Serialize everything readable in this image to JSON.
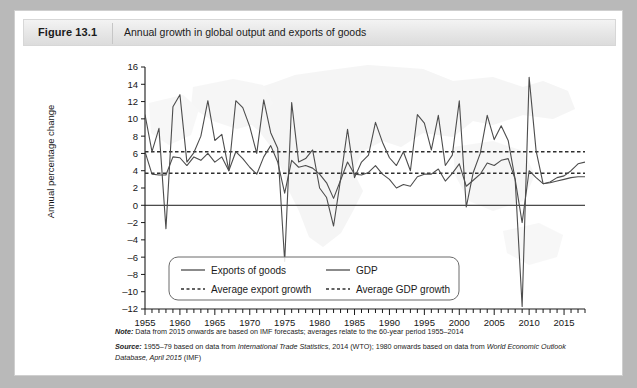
{
  "figure": {
    "number": "Figure 13.1",
    "caption": "Annual growth in global output and exports of goods"
  },
  "notes": {
    "note_label": "Note:",
    "note_text": " Data from 2015 onwards are based on IMF forecasts; averages relate to the 60-year period 1955–2014",
    "source_label": "Source:",
    "source_a": " 1955–79 based on data from ",
    "source_italic_1": "International Trade Statistics",
    "source_b": ", 2014 (WTO); 1980 onwards based on data from ",
    "source_italic_2": "World Economic Outlook Database, April 2015",
    "source_c": " (IMF)"
  },
  "chart_data": {
    "type": "line",
    "title": "Annual growth in global output and exports of goods",
    "xlabel": "",
    "ylabel": "Annual percentage change",
    "xlim": [
      1955,
      2018
    ],
    "ylim": [
      -12,
      16
    ],
    "ytick_step": 2,
    "yticks": [
      -12,
      -10,
      -8,
      -6,
      -4,
      -2,
      0,
      2,
      4,
      6,
      8,
      10,
      12,
      14,
      16
    ],
    "xticks_major": [
      1955,
      1960,
      1965,
      1970,
      1975,
      1980,
      1985,
      1990,
      1995,
      2000,
      2005,
      2010,
      2015
    ],
    "minor_tick_interval": 1,
    "grid": false,
    "legend_position": "lower-left-inside",
    "zero_line": 0,
    "series": [
      {
        "name": "Exports of goods",
        "style": "solid",
        "color": "#4d4d4d",
        "x": [
          1955,
          1956,
          1957,
          1958,
          1959,
          1960,
          1961,
          1962,
          1963,
          1964,
          1965,
          1966,
          1967,
          1968,
          1969,
          1970,
          1971,
          1972,
          1973,
          1974,
          1975,
          1976,
          1977,
          1978,
          1979,
          1980,
          1981,
          1982,
          1983,
          1984,
          1985,
          1986,
          1987,
          1988,
          1989,
          1990,
          1991,
          1992,
          1993,
          1994,
          1995,
          1996,
          1997,
          1998,
          1999,
          2000,
          2001,
          2002,
          2003,
          2004,
          2005,
          2006,
          2007,
          2008,
          2009,
          2010,
          2011,
          2012,
          2013,
          2014,
          2015,
          2016,
          2017,
          2018
        ],
        "values": [
          10.5,
          6.2,
          8.9,
          -2.7,
          11.4,
          12.8,
          5.0,
          6.1,
          8.0,
          12.1,
          7.5,
          8.2,
          4.0,
          12.1,
          11.3,
          9.1,
          6.0,
          12.2,
          8.4,
          6.6,
          -6.5,
          11.9,
          5.0,
          5.4,
          6.4,
          2.0,
          0.9,
          -2.4,
          3.0,
          8.8,
          3.2,
          5.0,
          5.8,
          9.6,
          7.3,
          5.5,
          4.6,
          6.2,
          4.0,
          10.5,
          9.5,
          6.4,
          10.4,
          4.6,
          5.8,
          12.1,
          -0.2,
          3.8,
          6.0,
          10.4,
          7.6,
          9.2,
          7.5,
          3.0,
          -11.7,
          14.8,
          6.3,
          2.5,
          2.7,
          3.2,
          3.4,
          4.0,
          4.8,
          5.0
        ]
      },
      {
        "name": "GDP",
        "style": "solid",
        "color": "#4d4d4d",
        "x": [
          1955,
          1956,
          1957,
          1958,
          1959,
          1960,
          1961,
          1962,
          1963,
          1964,
          1965,
          1966,
          1967,
          1968,
          1969,
          1970,
          1971,
          1972,
          1973,
          1974,
          1975,
          1976,
          1977,
          1978,
          1979,
          1980,
          1981,
          1982,
          1983,
          1984,
          1985,
          1986,
          1987,
          1988,
          1989,
          1990,
          1991,
          1992,
          1993,
          1994,
          1995,
          1996,
          1997,
          1998,
          1999,
          2000,
          2001,
          2002,
          2003,
          2004,
          2005,
          2006,
          2007,
          2008,
          2009,
          2010,
          2011,
          2012,
          2013,
          2014,
          2015,
          2016,
          2017,
          2018
        ],
        "values": [
          6.2,
          3.6,
          3.5,
          3.5,
          5.6,
          5.5,
          4.6,
          5.6,
          5.2,
          6.0,
          5.0,
          5.6,
          4.0,
          6.2,
          5.4,
          4.4,
          3.6,
          5.6,
          6.9,
          5.0,
          1.4,
          5.2,
          4.4,
          4.6,
          4.3,
          3.6,
          2.6,
          0.8,
          2.9,
          5.0,
          3.6,
          3.5,
          3.8,
          4.6,
          3.6,
          3.0,
          2.0,
          2.4,
          2.2,
          3.3,
          3.6,
          3.6,
          4.2,
          2.8,
          3.7,
          4.8,
          2.2,
          2.9,
          3.6,
          4.9,
          4.6,
          5.2,
          5.4,
          3.0,
          -2.0,
          4.0,
          3.2,
          2.5,
          2.6,
          2.8,
          3.0,
          3.2,
          3.3,
          3.3
        ]
      }
    ],
    "reference_lines": [
      {
        "name": "Average export growth",
        "value": 6.2,
        "style": "dashed",
        "color": "#2f2f2f"
      },
      {
        "name": "Average GDP growth",
        "value": 3.7,
        "style": "dashed",
        "color": "#2f2f2f"
      }
    ],
    "legend": [
      {
        "label": "Exports of goods",
        "style": "solid"
      },
      {
        "label": "GDP",
        "style": "solid"
      },
      {
        "label": "Average export growth",
        "style": "dashed"
      },
      {
        "label": "Average GDP growth",
        "style": "dashed"
      }
    ]
  }
}
